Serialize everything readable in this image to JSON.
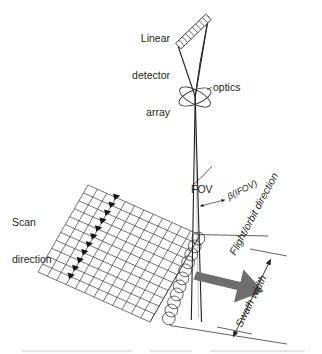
{
  "figure": {
    "background_color": "#ffffff",
    "ink_color": "#231f20",
    "arrow_color": "#6e6e6e",
    "width": 322,
    "height": 354
  },
  "labels": {
    "detector_array_line1": "Linear",
    "detector_array_line2": "detector",
    "detector_array_line3": "array",
    "optics": "optics",
    "scan_direction_line1": "Scan",
    "scan_direction_line2": "direction",
    "fov": "FOV",
    "ifov": "β(IFOV)",
    "flight_direction": "Flight/orbit direction",
    "swath_width": "Swath width"
  },
  "components": {
    "detector_array": {
      "name": "linear-detector-array",
      "element_count": 9,
      "start": [
        178,
        46
      ],
      "end": [
        208,
        17
      ]
    },
    "optics": {
      "name": "optics-lens",
      "center": [
        195,
        97
      ],
      "rx": 17,
      "ry": 7,
      "rotation_deg": -22
    },
    "fov_cone": {
      "apex": [
        195,
        97
      ],
      "left_ray_end": [
        192,
        314
      ],
      "right_ray_end": [
        200,
        316
      ],
      "arc_label": "FOV"
    },
    "ground_grid": {
      "name": "ground-swath-grid",
      "corners": [
        [
          88,
          185
        ],
        [
          200,
          235
        ],
        [
          180,
          313
        ],
        [
          38,
          272
        ]
      ],
      "columns": 12,
      "rows": 11
    },
    "scan_markers": {
      "name": "scan-direction-markers",
      "count": 11,
      "shape": "triangle"
    },
    "detector_footprints": {
      "name": "detector-footprint-circles",
      "count": 11,
      "shape": "circle",
      "radius": 6.5
    },
    "flight_arrow": {
      "name": "flight-direction-arrow",
      "color": "#6e6e6e",
      "from": [
        196,
        276
      ],
      "to": [
        262,
        292
      ]
    },
    "swath_dimension": {
      "name": "swath-width-dimension",
      "from": [
        270,
        259
      ],
      "to": [
        233,
        337
      ],
      "double_headed": true
    }
  }
}
